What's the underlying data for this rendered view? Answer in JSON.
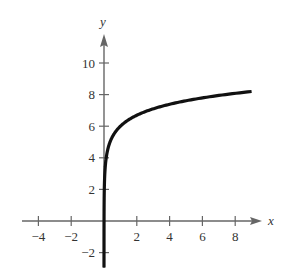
{
  "top_crop_text": "y =",
  "chart_data": {
    "type": "line",
    "title": "",
    "function": "y = 6 + ln x",
    "xlabel": "x",
    "ylabel": "y",
    "xlim": [
      -5,
      9.5
    ],
    "ylim": [
      -3,
      11.5
    ],
    "x_ticks": [
      -4,
      -2,
      2,
      4,
      6,
      8
    ],
    "y_ticks": [
      -2,
      2,
      4,
      6,
      8,
      10
    ],
    "grid": false,
    "series": [
      {
        "name": "f(x)",
        "x": [
          0.02,
          0.05,
          0.1,
          0.25,
          0.5,
          1,
          2,
          3,
          4,
          5,
          6,
          7,
          8,
          9
        ],
        "y": [
          2.09,
          3.0,
          3.7,
          4.61,
          5.31,
          6.0,
          6.69,
          7.1,
          7.39,
          7.61,
          7.79,
          7.95,
          8.08,
          8.2
        ]
      }
    ]
  },
  "colors": {
    "axis": "#666666",
    "curve": "#111111",
    "text": "#333333"
  }
}
